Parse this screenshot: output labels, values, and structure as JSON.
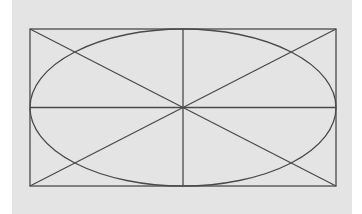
{
  "diagram": {
    "colors": {
      "background": "#e4e4e4",
      "page": "#ffffff",
      "stroke": "#4a4a4a"
    },
    "rectangle": {
      "x": 30,
      "y": 29,
      "width": 306,
      "height": 157
    },
    "ellipse": {
      "cx": 183,
      "cy": 107.5,
      "rx": 153,
      "ry": 78.5
    },
    "lines": [
      {
        "name": "diagonal-tl-br",
        "x1": 30,
        "y1": 29,
        "x2": 336,
        "y2": 186
      },
      {
        "name": "diagonal-bl-tr",
        "x1": 30,
        "y1": 186,
        "x2": 336,
        "y2": 29
      },
      {
        "name": "horizontal-center",
        "x1": 30,
        "y1": 107.5,
        "x2": 336,
        "y2": 107.5
      },
      {
        "name": "vertical-center",
        "x1": 183,
        "y1": 29,
        "x2": 183,
        "y2": 186
      }
    ]
  }
}
